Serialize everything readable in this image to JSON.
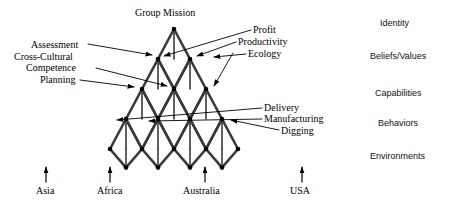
{
  "diagram": {
    "title_node": "Group Mission",
    "apex": {
      "x": 174,
      "y": 29
    },
    "levels": 5,
    "dx": 32,
    "dy": 30,
    "stroke_color": "#3a3a3a",
    "node_color": "#000000",
    "leader_color": "#000000"
  },
  "top_label": {
    "text": "Group Mission",
    "x": 135,
    "y": 8
  },
  "left_labels": [
    {
      "id": "assessment",
      "text": "Assessment",
      "x": 31,
      "y": 40
    },
    {
      "id": "cross-cultural",
      "text": "Cross-Cultural",
      "x": 14,
      "y": 53
    },
    {
      "id": "competence",
      "text": "Competence",
      "x": 26,
      "y": 64
    },
    {
      "id": "planning",
      "text": "Planning",
      "x": 40,
      "y": 76
    }
  ],
  "right_labels_top": [
    {
      "id": "profit",
      "text": "Profit",
      "x": 253,
      "y": 26
    },
    {
      "id": "productivity",
      "text": "Productivity",
      "x": 238,
      "y": 38
    },
    {
      "id": "ecology",
      "text": "Ecology",
      "x": 248,
      "y": 50
    }
  ],
  "right_labels_mid": [
    {
      "id": "delivery",
      "text": "Delivery",
      "x": 264,
      "y": 104
    },
    {
      "id": "manufacturing",
      "text": "Manufacturing",
      "x": 264,
      "y": 116
    },
    {
      "id": "digging",
      "text": "Digging",
      "x": 281,
      "y": 127
    }
  ],
  "bottom_labels": [
    {
      "id": "asia",
      "text": "Asia",
      "x": 36,
      "y": 186,
      "arrow_x": 46
    },
    {
      "id": "africa",
      "text": "Africa",
      "x": 97,
      "y": 186,
      "arrow_x": 110
    },
    {
      "id": "australia",
      "text": "Australia",
      "x": 183,
      "y": 186,
      "arrow_x": 205
    },
    {
      "id": "usa",
      "text": "USA",
      "x": 290,
      "y": 186,
      "arrow_x": 302
    }
  ],
  "side_levels": [
    {
      "id": "identity",
      "text": "Identity",
      "x": 380,
      "y": 19
    },
    {
      "id": "beliefs-values",
      "text": "Beliefs/Values",
      "x": 370,
      "y": 52
    },
    {
      "id": "capabilities",
      "text": "Capabilities",
      "x": 375,
      "y": 89
    },
    {
      "id": "behaviors",
      "text": "Behaviors",
      "x": 378,
      "y": 119
    },
    {
      "id": "environments",
      "text": "Environments",
      "x": 370,
      "y": 152
    }
  ]
}
